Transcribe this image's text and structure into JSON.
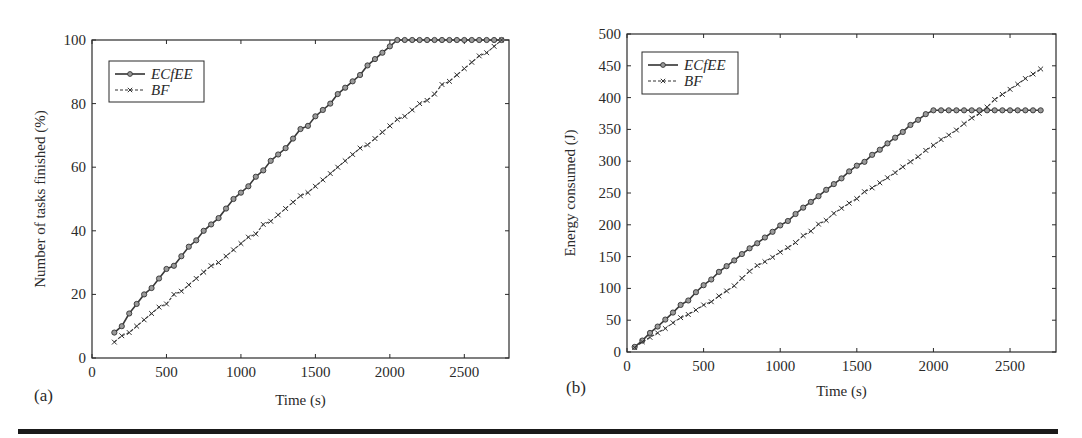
{
  "figure": {
    "panel_labels": [
      "(a)",
      "(b)"
    ]
  },
  "colors": {
    "axis": "#2a2a2a",
    "series_ecfee": "#3a3a3a",
    "series_bf": "#3a3a3a",
    "marker_fill": "#9a9a9a",
    "rule": "#1a1a1a"
  },
  "chart_data": [
    {
      "id": "a",
      "type": "line",
      "title": "",
      "panel_label": "(a)",
      "xlabel": "Time (s)",
      "ylabel": "Number of tasks finished (%)",
      "xlim": [
        0,
        2800
      ],
      "ylim": [
        0,
        100
      ],
      "xticks": [
        0,
        500,
        1000,
        1500,
        2000,
        2500
      ],
      "yticks": [
        0,
        20,
        40,
        60,
        80,
        100
      ],
      "grid": false,
      "legend_position": "upper left",
      "series": [
        {
          "name": "ECfEE",
          "style": "solid",
          "marker": "circle",
          "x": [
            150,
            200,
            250,
            300,
            350,
            400,
            450,
            500,
            550,
            600,
            650,
            700,
            750,
            800,
            850,
            900,
            950,
            1000,
            1050,
            1100,
            1150,
            1200,
            1250,
            1300,
            1350,
            1400,
            1450,
            1500,
            1550,
            1600,
            1650,
            1700,
            1750,
            1800,
            1850,
            1900,
            1950,
            2000,
            2050,
            2100,
            2150,
            2200,
            2250,
            2300,
            2350,
            2400,
            2450,
            2500,
            2550,
            2600,
            2650,
            2700,
            2750
          ],
          "values": [
            8,
            10,
            14,
            17,
            20,
            22,
            25,
            28,
            29,
            32,
            35,
            37,
            40,
            42,
            44,
            47,
            50,
            52,
            54,
            57,
            59,
            62,
            64,
            66,
            69,
            72,
            73,
            76,
            78,
            80,
            83,
            85,
            87,
            89,
            92,
            94,
            96,
            98,
            100,
            100,
            100,
            100,
            100,
            100,
            100,
            100,
            100,
            100,
            100,
            100,
            100,
            100,
            100
          ]
        },
        {
          "name": "BF",
          "style": "dashed",
          "marker": "x",
          "x": [
            150,
            200,
            250,
            300,
            350,
            400,
            450,
            500,
            550,
            600,
            650,
            700,
            750,
            800,
            850,
            900,
            950,
            1000,
            1050,
            1100,
            1150,
            1200,
            1250,
            1300,
            1350,
            1400,
            1450,
            1500,
            1550,
            1600,
            1650,
            1700,
            1750,
            1800,
            1850,
            1900,
            1950,
            2000,
            2050,
            2100,
            2150,
            2200,
            2250,
            2300,
            2350,
            2400,
            2450,
            2500,
            2550,
            2600,
            2650,
            2700,
            2750
          ],
          "values": [
            5,
            7,
            8,
            10,
            12,
            14,
            16,
            17,
            20,
            21,
            23,
            25,
            27,
            29,
            30,
            32,
            34,
            36,
            38,
            39,
            42,
            43,
            45,
            47,
            49,
            51,
            52,
            54,
            56,
            58,
            60,
            62,
            64,
            66,
            67,
            69,
            71,
            73,
            75,
            76,
            78,
            80,
            81,
            83,
            86,
            87,
            89,
            91,
            93,
            95,
            96,
            98,
            100
          ]
        }
      ]
    },
    {
      "id": "b",
      "type": "line",
      "title": "",
      "panel_label": "(b)",
      "xlabel": "Time (s)",
      "ylabel": "Energy consumed (J)",
      "xlim": [
        0,
        2800
      ],
      "ylim": [
        0,
        500
      ],
      "xticks": [
        0,
        500,
        1000,
        1500,
        2000,
        2500
      ],
      "yticks": [
        0,
        50,
        100,
        150,
        200,
        250,
        300,
        350,
        400,
        450,
        500
      ],
      "grid": false,
      "legend_position": "upper left",
      "series": [
        {
          "name": "ECfEE",
          "style": "solid",
          "marker": "circle",
          "x": [
            50,
            100,
            150,
            200,
            250,
            300,
            350,
            400,
            450,
            500,
            550,
            600,
            650,
            700,
            750,
            800,
            850,
            900,
            950,
            1000,
            1050,
            1100,
            1150,
            1200,
            1250,
            1300,
            1350,
            1400,
            1450,
            1500,
            1550,
            1600,
            1650,
            1700,
            1750,
            1800,
            1850,
            1900,
            1950,
            2000,
            2050,
            2100,
            2150,
            2200,
            2250,
            2300,
            2350,
            2400,
            2450,
            2500,
            2550,
            2600,
            2650,
            2700
          ],
          "values": [
            8,
            18,
            30,
            40,
            51,
            62,
            74,
            81,
            94,
            105,
            114,
            126,
            135,
            144,
            154,
            163,
            171,
            180,
            189,
            199,
            206,
            217,
            227,
            236,
            245,
            255,
            264,
            273,
            284,
            293,
            299,
            310,
            318,
            328,
            337,
            346,
            357,
            365,
            374,
            380,
            380,
            380,
            380,
            380,
            380,
            380,
            380,
            380,
            380,
            380,
            380,
            380,
            380,
            380
          ]
        },
        {
          "name": "BF",
          "style": "dashed",
          "marker": "x",
          "x": [
            50,
            100,
            150,
            200,
            250,
            300,
            350,
            400,
            450,
            500,
            550,
            600,
            650,
            700,
            750,
            800,
            850,
            900,
            950,
            1000,
            1050,
            1100,
            1150,
            1200,
            1250,
            1300,
            1350,
            1400,
            1450,
            1500,
            1550,
            1600,
            1650,
            1700,
            1750,
            1800,
            1850,
            1900,
            1950,
            2000,
            2050,
            2100,
            2150,
            2200,
            2250,
            2300,
            2350,
            2400,
            2450,
            2500,
            2550,
            2600,
            2650,
            2700
          ],
          "values": [
            7,
            16,
            23,
            30,
            37,
            46,
            54,
            59,
            66,
            74,
            79,
            88,
            96,
            104,
            116,
            127,
            136,
            142,
            149,
            157,
            164,
            172,
            183,
            190,
            201,
            207,
            218,
            226,
            234,
            241,
            252,
            258,
            266,
            274,
            282,
            291,
            299,
            307,
            317,
            325,
            334,
            341,
            349,
            359,
            368,
            375,
            385,
            397,
            405,
            413,
            421,
            430,
            437,
            445
          ]
        }
      ]
    }
  ]
}
